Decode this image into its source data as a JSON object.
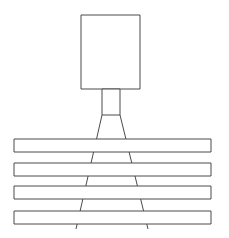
{
  "canvas": {
    "width": 229,
    "height": 238,
    "background_color": "#ffffff",
    "stroke_color": "#4a4a4a",
    "fill_color": "#ffffff",
    "stroke_width": 1,
    "title": "Sensor projecting beam across stacked bars"
  },
  "diagram": {
    "type": "line-drawing",
    "emitter_body": {
      "label": "emitter-body",
      "shape": "rectangle",
      "x": 81,
      "y": 15,
      "width": 59,
      "height": 74
    },
    "emitter_neck": {
      "label": "emitter-neck",
      "shape": "rectangle",
      "x": 102,
      "y": 89,
      "width": 18,
      "height": 26
    },
    "beam": {
      "label": "projection-beam",
      "shape": "open-cone",
      "apex_left_x": 102,
      "apex_right_x": 120,
      "apex_y": 115,
      "base_left_x": 76,
      "base_right_x": 148,
      "base_y": 229
    },
    "bars": [
      {
        "label": "bar-1",
        "x": 14,
        "y": 139,
        "width": 197,
        "height": 13
      },
      {
        "label": "bar-2",
        "x": 14,
        "y": 163,
        "width": 197,
        "height": 13
      },
      {
        "label": "bar-3",
        "x": 14,
        "y": 186,
        "width": 197,
        "height": 13
      },
      {
        "label": "bar-4",
        "x": 14,
        "y": 211,
        "width": 197,
        "height": 13
      }
    ]
  }
}
